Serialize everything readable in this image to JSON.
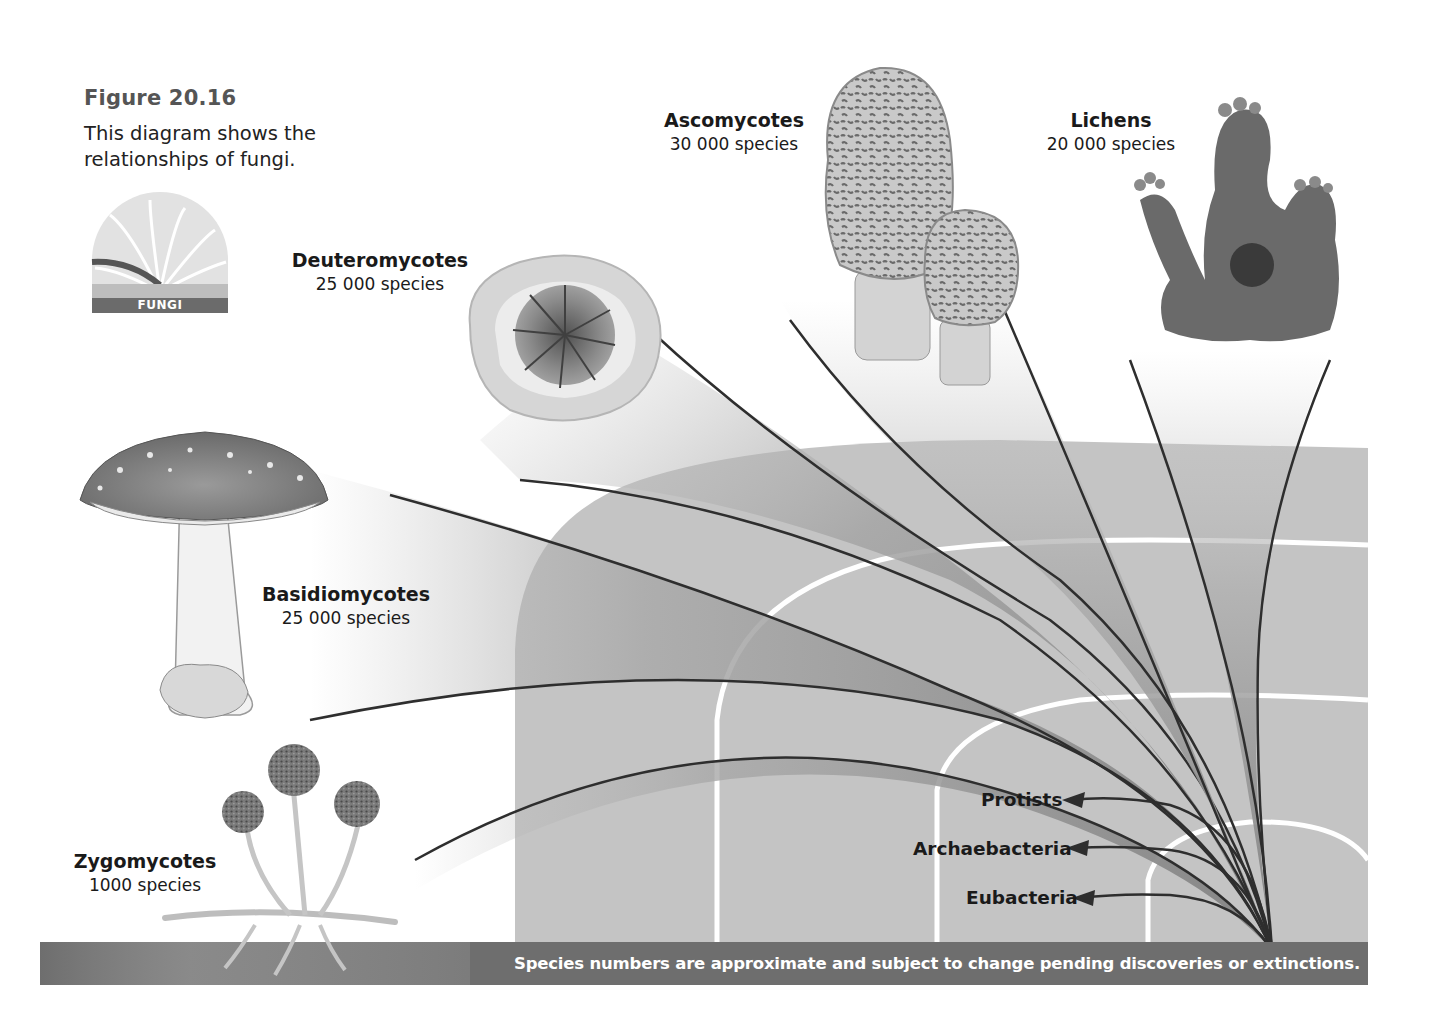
{
  "figure": {
    "number": "Figure 20.16",
    "caption_line1": "This diagram shows the",
    "caption_line2": "relationships of fungi."
  },
  "icon_badge": {
    "label": "FUNGI",
    "icon": "fungi-fan-icon"
  },
  "groups": [
    {
      "name": "Ascomycotes",
      "species": "30 000 species",
      "illustration": "morel-mushroom-icon"
    },
    {
      "name": "Lichens",
      "species": "20 000 species",
      "illustration": "lichen-icon"
    },
    {
      "name": "Deuteromycotes",
      "species": "25 000 species",
      "illustration": "deuteromycete-disc-icon"
    },
    {
      "name": "Basidiomycotes",
      "species": "25 000 species",
      "illustration": "amanita-mushroom-icon"
    },
    {
      "name": "Zygomycotes",
      "species": "1000 species",
      "illustration": "bread-mold-icon"
    }
  ],
  "outgroups": [
    {
      "name": "Protists"
    },
    {
      "name": "Archaebacteria"
    },
    {
      "name": "Eubacteria"
    }
  ],
  "footer": {
    "note": "Species numbers are approximate and subject to change pending discoveries or extinctions."
  },
  "colors": {
    "arch": "#c4c4c4",
    "branch_fill": "#8a8a8a",
    "branch_line": "#2e2e2e",
    "footer_bar": "#6e6e6e",
    "text": "#1a1a1a"
  }
}
